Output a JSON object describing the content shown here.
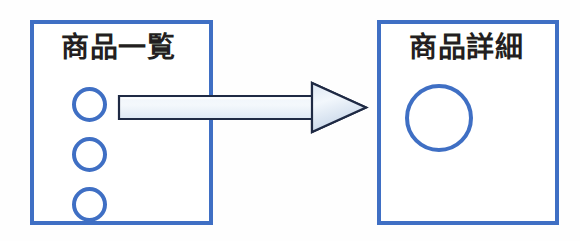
{
  "diagram": {
    "background_color": "#fefefe",
    "accent_color": "#3f6fc4",
    "text_color": "#231f20",
    "arrow_fill_light": "#eef3fa",
    "arrow_fill_mid": "#dbe5f1",
    "arrow_fill_shadow": "#c3d3e8",
    "arrow_outline": "#1f2a44",
    "nodes": [
      {
        "id": "product-list",
        "label": "商品一覧",
        "shape": "rectangle",
        "items": [
          {
            "id": "list-item-1",
            "shape": "circle"
          },
          {
            "id": "list-item-2",
            "shape": "circle"
          },
          {
            "id": "list-item-3",
            "shape": "circle"
          }
        ]
      },
      {
        "id": "product-detail",
        "label": "商品詳細",
        "shape": "rectangle",
        "items": [
          {
            "id": "detail-item-1",
            "shape": "circle"
          }
        ]
      }
    ],
    "connector": {
      "id": "transition-arrow",
      "from": "product-list",
      "to": "product-detail",
      "direction": "right",
      "style": "block-arrow-3d"
    }
  }
}
